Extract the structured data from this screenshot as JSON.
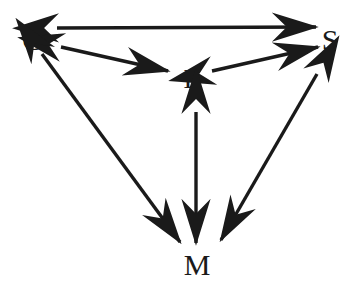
{
  "figure": {
    "type": "node-link-diagram",
    "title": "",
    "background_color": "#ffffff",
    "stroke_color": "#1a1a1a",
    "label_color": "#1a1a1a"
  },
  "nodes": [
    {
      "id": "G",
      "label": "G",
      "x": 33,
      "y": 40,
      "position": "top-left"
    },
    {
      "id": "S",
      "label": "S",
      "x": 330,
      "y": 40,
      "position": "top-right"
    },
    {
      "id": "L",
      "label": "L",
      "x": 192,
      "y": 79,
      "position": "center"
    },
    {
      "id": "M",
      "label": "M",
      "x": 197,
      "y": 265,
      "position": "bottom"
    }
  ],
  "edges": [
    {
      "id": "G-S",
      "from": "G",
      "to": "S",
      "direction": "bidirectional",
      "label": "",
      "x1": 57,
      "y1": 28,
      "x2": 316,
      "y2": 27
    },
    {
      "id": "G-L",
      "from": "G",
      "to": "L",
      "direction": "bidirectional",
      "label": "",
      "x1": 61,
      "y1": 47,
      "x2": 168,
      "y2": 71
    },
    {
      "id": "L-S",
      "from": "L",
      "to": "S",
      "direction": "bidirectional",
      "label": "",
      "x1": 212,
      "y1": 71,
      "x2": 318,
      "y2": 47
    },
    {
      "id": "G-M",
      "from": "G",
      "to": "M",
      "direction": "bidirectional",
      "label": "",
      "x1": 42,
      "y1": 54,
      "x2": 180,
      "y2": 242
    },
    {
      "id": "L-M",
      "from": "L",
      "to": "M",
      "direction": "bidirectional",
      "label": "",
      "x1": 196,
      "y1": 112,
      "x2": 196,
      "y2": 243
    },
    {
      "id": "S-M",
      "from": "S",
      "to": "M",
      "direction": "bidirectional",
      "label": "",
      "x1": 317,
      "y1": 74,
      "x2": 221,
      "y2": 240
    }
  ]
}
